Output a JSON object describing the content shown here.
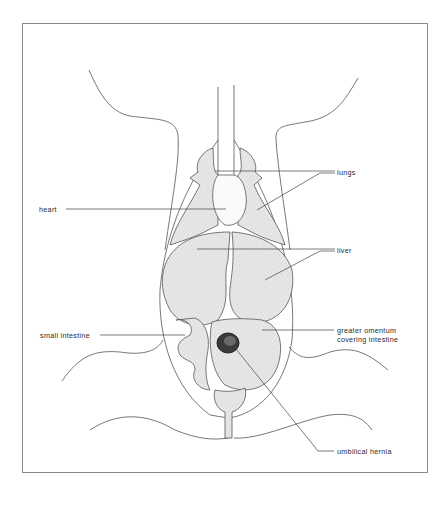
{
  "figure": {
    "type": "anatomical diagram",
    "colors": {
      "line": "#4a4a4a",
      "organ_fill": "#e6e6e6",
      "frame": "#8a8a8a",
      "background": "#ffffff"
    }
  },
  "labels": {
    "lungs": "lungs",
    "heart": "heart",
    "liver": "liver",
    "small_intestine": "small intestine",
    "greater_omentum_line1": "greater omentum",
    "greater_omentum_line2": "covering intestine",
    "umbilical_hernia": "umbilical hernia"
  }
}
